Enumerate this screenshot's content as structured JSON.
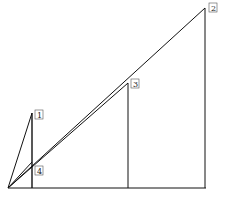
{
  "diagram": {
    "origin": {
      "x": 8,
      "y": 188
    },
    "baseline_end": {
      "x": 206,
      "y": 188
    },
    "points": [
      {
        "id": "1",
        "label": "1",
        "x": 32,
        "y": 113,
        "foot_x": 32,
        "label_x": 35,
        "label_y": 110
      },
      {
        "id": "2",
        "label": "2",
        "x": 205,
        "y": 8,
        "foot_x": 205,
        "label_x": 209,
        "label_y": 3
      },
      {
        "id": "3",
        "label": "3",
        "x": 128,
        "y": 83,
        "foot_x": 128,
        "label_x": 131,
        "label_y": 79
      },
      {
        "id": "4",
        "label": "4",
        "x": 32,
        "y": 162,
        "foot_x": 32,
        "label_x": 35,
        "label_y": 166
      }
    ],
    "stroke_color": "#111111"
  }
}
